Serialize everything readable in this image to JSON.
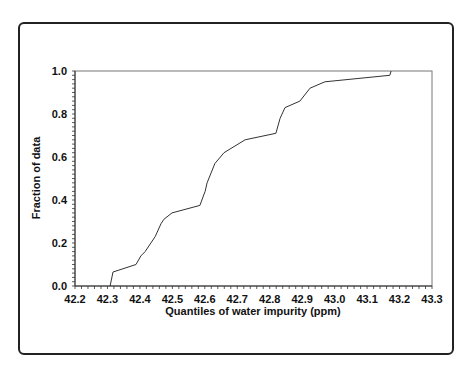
{
  "chart_data": {
    "type": "line",
    "title": "",
    "xlabel": "Quantiles of water impurity (ppm)",
    "ylabel": "Fraction of data",
    "xlim": [
      42.2,
      43.3
    ],
    "ylim": [
      0.0,
      1.0
    ],
    "x_ticks": [
      "42.2",
      "42.3",
      "42.4",
      "42.5",
      "42.6",
      "42.7",
      "42.8",
      "42.9",
      "43.0",
      "43.1",
      "43.2",
      "43.3"
    ],
    "y_ticks": [
      "0.0",
      "0.2",
      "0.4",
      "0.6",
      "0.8",
      "1.0"
    ],
    "grid": false,
    "legend": null,
    "series": [
      {
        "name": "Empirical CDF",
        "x": [
          42.308,
          42.317,
          42.388,
          42.403,
          42.416,
          42.447,
          42.465,
          42.474,
          42.499,
          42.585,
          42.601,
          42.607,
          42.631,
          42.659,
          42.724,
          42.819,
          42.832,
          42.847,
          42.893,
          42.924,
          42.97,
          43.17,
          43.174
        ],
        "y": [
          0.0,
          0.065,
          0.1,
          0.14,
          0.16,
          0.23,
          0.29,
          0.31,
          0.34,
          0.375,
          0.44,
          0.48,
          0.57,
          0.62,
          0.68,
          0.71,
          0.78,
          0.83,
          0.86,
          0.92,
          0.95,
          0.98,
          1.0
        ]
      }
    ]
  }
}
